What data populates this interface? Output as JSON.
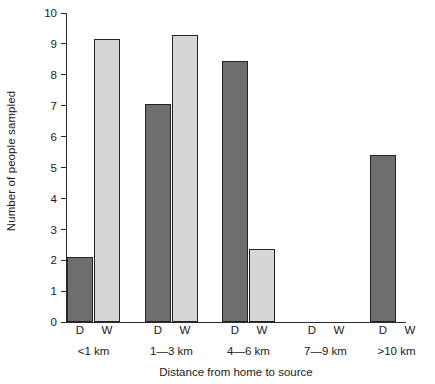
{
  "chart_data": {
    "type": "bar",
    "title": "",
    "xlabel": "Distance from home to source",
    "ylabel": "Number of people sampled",
    "ylim": [
      0,
      10
    ],
    "ytick_labels": [
      "0",
      "1",
      "2",
      "3",
      "4",
      "5",
      "6",
      "7",
      "8",
      "9",
      "10"
    ],
    "ytick_values": [
      0,
      1,
      2,
      3,
      4,
      5,
      6,
      7,
      8,
      9,
      10
    ],
    "grid": false,
    "legend_position": "none",
    "categories": [
      "<1 km",
      "1—3 km",
      "4—6 km",
      "7—9 km",
      ">10 km"
    ],
    "subcategory_labels": [
      "D",
      "W"
    ],
    "series": [
      {
        "name": "D",
        "color": "#6e6e6e",
        "values": [
          2.1,
          7.05,
          8.45,
          0,
          5.4
        ]
      },
      {
        "name": "W",
        "color": "#d6d6d6",
        "values": [
          9.15,
          9.3,
          2.35,
          0,
          0
        ]
      }
    ],
    "bars": [
      {
        "group": "<1 km",
        "series": "D",
        "value": 2.1,
        "shade": "dark"
      },
      {
        "group": "<1 km",
        "series": "W",
        "value": 9.15,
        "shade": "light"
      },
      {
        "group": "1—3 km",
        "series": "D",
        "value": 7.05,
        "shade": "dark"
      },
      {
        "group": "1—3 km",
        "series": "W",
        "value": 9.3,
        "shade": "light"
      },
      {
        "group": "4—6 km",
        "series": "D",
        "value": 8.45,
        "shade": "dark"
      },
      {
        "group": "4—6 km",
        "series": "W",
        "value": 2.35,
        "shade": "light"
      },
      {
        "group": "7—9 km",
        "series": "D",
        "value": 0,
        "shade": "dark"
      },
      {
        "group": "7—9 km",
        "series": "W",
        "value": 0,
        "shade": "light"
      },
      {
        "group": ">10 km",
        "series": "D",
        "value": 5.4,
        "shade": "dark"
      },
      {
        "group": ">10 km",
        "series": "W",
        "value": 0,
        "shade": "light"
      }
    ]
  },
  "axes": {
    "y_title": "Number of people sampled",
    "x_title": "Distance from home to source",
    "y_ticks": [
      "10",
      "9",
      "8",
      "7",
      "6",
      "5",
      "4",
      "3",
      "2",
      "1",
      "0"
    ]
  },
  "colors": {
    "bar_dark": "#6e6e6e",
    "bar_light": "#d6d6d6",
    "bar_outline": "#232323",
    "axis": "#2b2b2b",
    "background": "#ffffff",
    "text": "#1a1a1a"
  }
}
